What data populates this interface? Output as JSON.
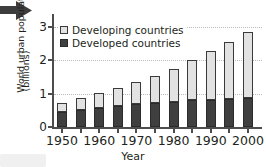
{
  "figure": {
    "decorations": {
      "arrow_icon": "right-arrow-icon",
      "corner_box": ""
    }
  },
  "chart_data": {
    "type": "bar",
    "stacked": true,
    "title": "",
    "xlabel": "Year",
    "ylabel": "World urban population",
    "ylabel_line1": "World urban population",
    "ylabel_line2": "(billions)",
    "ylim": [
      0,
      3.15
    ],
    "yticks": [
      0,
      1,
      2,
      3
    ],
    "ytick_labels": [
      "0",
      "1",
      "2",
      "3"
    ],
    "grid": "horizontal-dotted",
    "legend_position": "upper-left-inside",
    "categories": [
      1950,
      1955,
      1960,
      1965,
      1970,
      1975,
      1980,
      1985,
      1990,
      1995,
      2000
    ],
    "xtick_labels": [
      "1950",
      "1960",
      "1970",
      "1980",
      "1990",
      "2000"
    ],
    "xtick_categories": [
      1950,
      1960,
      1970,
      1980,
      1990,
      2000
    ],
    "series": [
      {
        "name": "Developed countries",
        "color": "#3f3f3f",
        "values": [
          0.45,
          0.5,
          0.57,
          0.62,
          0.68,
          0.73,
          0.76,
          0.8,
          0.82,
          0.85,
          0.88
        ]
      },
      {
        "name": "Developing countries",
        "color": "#e2e2e2",
        "values": [
          0.28,
          0.37,
          0.45,
          0.55,
          0.67,
          0.81,
          0.99,
          1.2,
          1.45,
          1.7,
          1.97
        ]
      }
    ],
    "totals": [
      0.73,
      0.87,
      1.02,
      1.17,
      1.35,
      1.54,
      1.75,
      2.0,
      2.27,
      2.55,
      2.85
    ]
  },
  "legend": {
    "items": [
      {
        "label": "Developing countries",
        "swatch": "developing"
      },
      {
        "label": "Developed countries",
        "swatch": "developed"
      }
    ]
  }
}
